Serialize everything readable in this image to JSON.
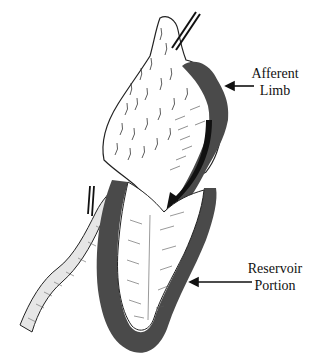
{
  "figure": {
    "colors": {
      "background": "#ffffff",
      "shading": "#4a4a4a",
      "line": "#1a1a1a"
    }
  },
  "labels": {
    "afferent_line1": "Afferent",
    "afferent_line2": "Limb",
    "reservoir_line1": "Reservoir",
    "reservoir_line2": "Portion"
  }
}
